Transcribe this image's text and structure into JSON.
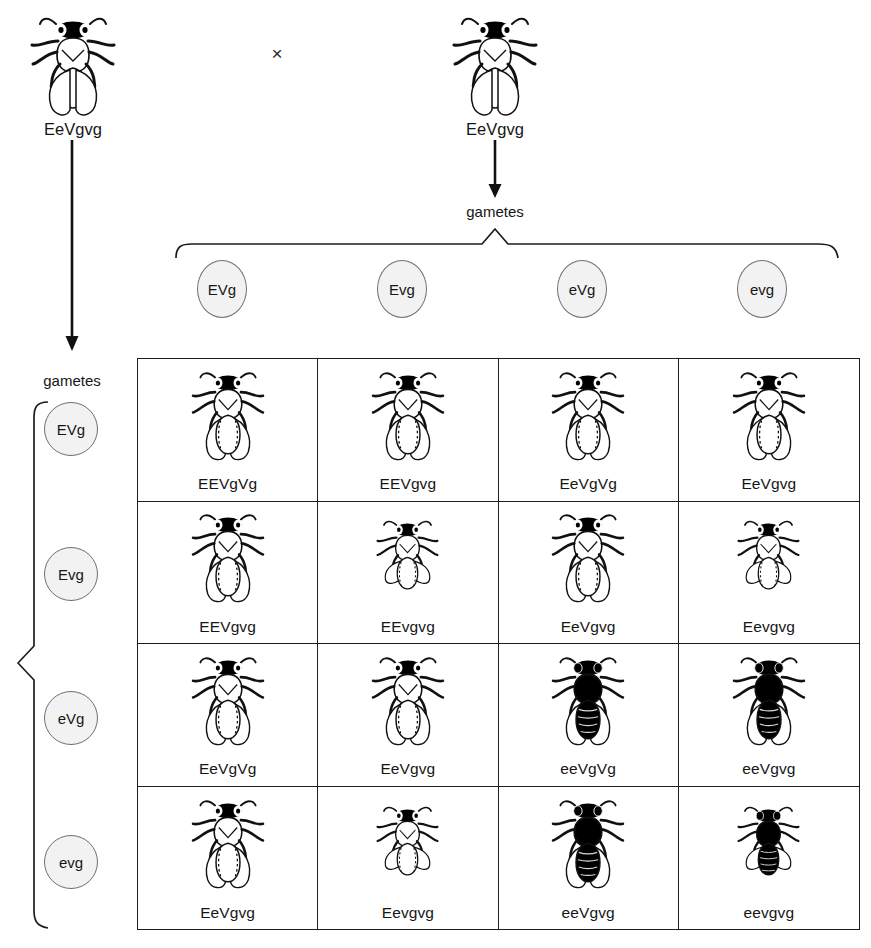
{
  "diagram": {
    "cross_symbol": "×",
    "gametes_word": "gametes"
  },
  "parents": {
    "left": {
      "genotype": "EeVgvg",
      "fly": "fly-icon-normal-grey",
      "body": "grey",
      "wings": "normal"
    },
    "right": {
      "genotype": "EeVgvg",
      "fly": "fly-icon-normal-grey",
      "body": "grey",
      "wings": "normal"
    }
  },
  "gametes": {
    "top": [
      "EVg",
      "Evg",
      "eVg",
      "evg"
    ],
    "left": [
      "EVg",
      "Evg",
      "eVg",
      "evg"
    ]
  },
  "chart_data": {
    "type": "table",
    "col_headers": [
      "EVg",
      "Evg",
      "eVg",
      "evg"
    ],
    "row_headers": [
      "EVg",
      "Evg",
      "eVg",
      "evg"
    ],
    "cells": [
      [
        {
          "genotype": "EEVgVg",
          "body": "grey",
          "wings": "normal"
        },
        {
          "genotype": "EEVgvg",
          "body": "grey",
          "wings": "normal"
        },
        {
          "genotype": "EeVgVg",
          "body": "grey",
          "wings": "normal"
        },
        {
          "genotype": "EeVgvg",
          "body": "grey",
          "wings": "normal"
        }
      ],
      [
        {
          "genotype": "EEVgvg",
          "body": "grey",
          "wings": "normal"
        },
        {
          "genotype": "EEvgvg",
          "body": "grey",
          "wings": "vestigial"
        },
        {
          "genotype": "EeVgvg",
          "body": "grey",
          "wings": "normal"
        },
        {
          "genotype": "Eevgvg",
          "body": "grey",
          "wings": "vestigial"
        }
      ],
      [
        {
          "genotype": "EeVgVg",
          "body": "grey",
          "wings": "normal"
        },
        {
          "genotype": "EeVgvg",
          "body": "grey",
          "wings": "normal"
        },
        {
          "genotype": "eeVgVg",
          "body": "ebony",
          "wings": "normal"
        },
        {
          "genotype": "eeVgvg",
          "body": "ebony",
          "wings": "normal"
        }
      ],
      [
        {
          "genotype": "EeVgvg",
          "body": "grey",
          "wings": "normal"
        },
        {
          "genotype": "Eevgvg",
          "body": "grey",
          "wings": "vestigial"
        },
        {
          "genotype": "eeVgvg",
          "body": "ebony",
          "wings": "normal"
        },
        {
          "genotype": "eevgvg",
          "body": "ebony",
          "wings": "vestigial"
        }
      ]
    ]
  },
  "colors": {
    "ink": "#161616",
    "rule": "#1d1d1d",
    "circle_fill": "#f2f2f2",
    "circle_stroke": "#6f6f6f",
    "ebony_body": "#000000",
    "grey_body": "#ffffff",
    "background": "#ffffff"
  }
}
